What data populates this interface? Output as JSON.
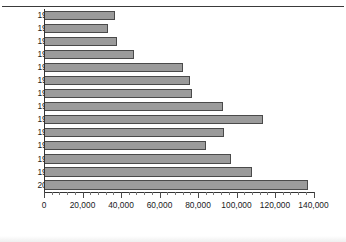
{
  "figure": {
    "title": "Figure 1: Asylum applications, Great Britain",
    "title_visible_fragment": "pplications, Great Britain"
  },
  "chart_data": {
    "type": "bar",
    "orientation": "horizontal",
    "title": "Asylum applications, Great Britain",
    "xlabel": "",
    "ylabel": "",
    "xlim": [
      0,
      140000
    ],
    "xtick_step": 20000,
    "minor_ticks_per_major": 4,
    "grid": false,
    "legend": null,
    "bar_color": "#9b9b9b",
    "bar_border_color": "#4a4a4a",
    "categories": [
      "1987–88",
      "1988–89",
      "1989–90",
      "1990–91",
      "1991–92",
      "1992–93",
      "1993–94",
      "1994–95",
      "1995–96",
      "1996–97",
      "1997–98",
      "1998–99",
      "1999–00",
      "2000–01"
    ],
    "values": [
      37000,
      33000,
      38000,
      47000,
      72000,
      76000,
      77000,
      93000,
      114000,
      93500,
      84000,
      97000,
      108000,
      137000
    ],
    "xtick_labels": [
      "0",
      "20,000",
      "40,000",
      "60,000",
      "80,000",
      "100,000",
      "120,000",
      "140,000"
    ],
    "xtick_values": [
      0,
      20000,
      40000,
      60000,
      80000,
      100000,
      120000,
      140000
    ]
  }
}
